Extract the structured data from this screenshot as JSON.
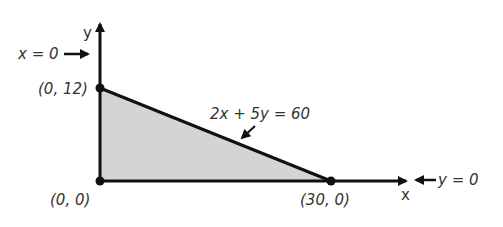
{
  "diagram": {
    "type": "feasible-region",
    "axes": {
      "x_label": "x",
      "y_label": "y"
    },
    "constraints": [
      {
        "label": "x = 0",
        "kind": "y-axis boundary"
      },
      {
        "label": "y = 0",
        "kind": "x-axis boundary"
      },
      {
        "label": "2x + 5y = 60",
        "kind": "line"
      }
    ],
    "vertices": [
      {
        "label": "(0, 12)",
        "x": 0,
        "y": 12
      },
      {
        "label": "(0, 0)",
        "x": 0,
        "y": 0
      },
      {
        "label": "(30, 0)",
        "x": 30,
        "y": 0
      }
    ],
    "region_fill": "#d4d4d4",
    "line_color": "#111111"
  }
}
